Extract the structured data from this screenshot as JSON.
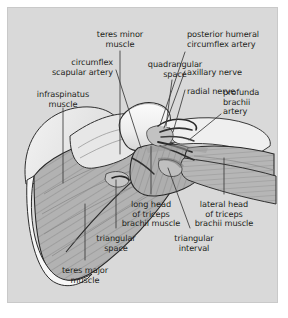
{
  "figure": {
    "kind": "anatomical-illustration",
    "region": "posterior shoulder and upper arm",
    "panel_background": "#d9d9d9",
    "page_background": "#ffffff",
    "ink_color": "#231f20",
    "leader_line_color": "#3a3a3a"
  },
  "labels": [
    {
      "id": "teres-minor-muscle",
      "lines": [
        "teres minor",
        "muscle"
      ],
      "x": 112,
      "y": 22,
      "align": "center"
    },
    {
      "id": "circumflex-scapular-artery",
      "lines": [
        "circumflex",
        "scapular artery"
      ],
      "x": 105,
      "y": 50,
      "align": "right"
    },
    {
      "id": "quadrangular-space",
      "lines": [
        "quadrangular",
        "space"
      ],
      "x": 167,
      "y": 52,
      "align": "center"
    },
    {
      "id": "posterior-humeral-circumflex-artery",
      "lines": [
        "posterior humeral",
        "circumflex artery"
      ],
      "x": 179,
      "y": 22,
      "align": "left"
    },
    {
      "id": "axillary-nerve",
      "lines": [
        "axillary nerve"
      ],
      "x": 179,
      "y": 60,
      "align": "left"
    },
    {
      "id": "radial-nerve",
      "lines": [
        "radial nerve"
      ],
      "x": 179,
      "y": 79,
      "align": "left"
    },
    {
      "id": "profunda-brachii-artery",
      "lines": [
        "profunda",
        "brachii",
        "artery"
      ],
      "x": 215,
      "y": 80,
      "align": "left"
    },
    {
      "id": "infraspinatus-muscle",
      "lines": [
        "infraspinatus",
        "muscle"
      ],
      "x": 55,
      "y": 82,
      "align": "center"
    },
    {
      "id": "long-head-of-triceps-brachii-muscle",
      "lines": [
        "long head",
        "of triceps",
        "brachii muscle"
      ],
      "x": 143,
      "y": 192,
      "align": "center"
    },
    {
      "id": "lateral-head-of-triceps-brachii-muscle",
      "lines": [
        "lateral head",
        "of triceps",
        "brachii muscle"
      ],
      "x": 216,
      "y": 192,
      "align": "center"
    },
    {
      "id": "triangular-space",
      "lines": [
        "triangular",
        "space"
      ],
      "x": 108,
      "y": 226,
      "align": "center"
    },
    {
      "id": "triangular-interval",
      "lines": [
        "triangular",
        "interval"
      ],
      "x": 186,
      "y": 226,
      "align": "center"
    },
    {
      "id": "teres-major-muscle",
      "lines": [
        "teres major",
        "muscle"
      ],
      "x": 77,
      "y": 258,
      "align": "center"
    }
  ],
  "leaders": [
    {
      "id": "leader-teres-minor-muscle",
      "path": "M 112,43 L 112,146"
    },
    {
      "id": "leader-circumflex-scapular-artery",
      "path": "M 108,62 L 133,140"
    },
    {
      "id": "leader-quadrangular-space",
      "path": "M 164,72 L 158,118"
    },
    {
      "id": "leader-posterior-humeral-circumflex-artery",
      "path": "M 177,44 L 152,117"
    },
    {
      "id": "leader-axillary-nerve",
      "path": "M 177,63 L 156,120"
    },
    {
      "id": "leader-radial-nerve",
      "path": "M 177,82 L 165,124"
    },
    {
      "id": "leader-profunda-brachii-artery",
      "path": "M 213,106 L 181,132"
    },
    {
      "id": "leader-infraspinatus-muscle",
      "path": "M 55,100 L 55,175"
    },
    {
      "id": "leader-long-head-of-triceps",
      "path": "M 143,186 L 143,138"
    },
    {
      "id": "leader-lateral-head-of-triceps",
      "path": "M 216,186 L 216,150"
    },
    {
      "id": "leader-triangular-space",
      "path": "M 108,220 L 108,172"
    },
    {
      "id": "leader-triangular-interval",
      "path": "M 182,220 L 160,160"
    },
    {
      "id": "leader-teres-major-muscle",
      "path": "M 77,252 L 77,196"
    }
  ]
}
